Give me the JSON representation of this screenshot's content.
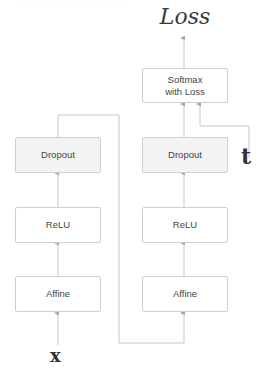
{
  "diagram": {
    "top_clipped_text": "· · · · · · · · · · · · ·",
    "output_label": "Loss",
    "target_label": "t",
    "input_label": "x",
    "colors": {
      "box_border": "#cfcfcf",
      "dropout_fill": "#f3f3f3",
      "wire": "#c8c8c8",
      "text": "#444444"
    },
    "left_column": {
      "layers": [
        {
          "label": "Dropout"
        },
        {
          "label": "ReLU"
        },
        {
          "label": "Affine"
        }
      ]
    },
    "right_column": {
      "layers": [
        {
          "label": "Softmax\nwith Loss"
        },
        {
          "label": "Dropout"
        },
        {
          "label": "ReLU"
        },
        {
          "label": "Affine"
        }
      ]
    }
  }
}
